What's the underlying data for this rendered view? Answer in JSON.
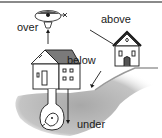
{
  "figure": {
    "type": "preposition-illustration",
    "labels": {
      "over": "over",
      "above": "above",
      "below": "below",
      "under": "under"
    },
    "objects": [
      "hot-air-balloon",
      "house-main",
      "house-hill",
      "hill",
      "underground-tunnel",
      "person-underground"
    ],
    "colors": {
      "ink": "#1a1a1a",
      "ground": "#b4b4b4",
      "ground_light": "#d8d8d8",
      "border": "#8a8a8a",
      "background": "#ffffff"
    }
  }
}
